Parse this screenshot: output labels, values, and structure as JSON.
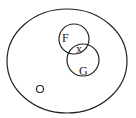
{
  "diagram": {
    "type": "venn",
    "universe": {
      "cx": 67,
      "cy": 61,
      "rx": 60,
      "ry": 52
    },
    "sets": [
      {
        "name": "F",
        "label": "F",
        "cx": 74,
        "cy": 39,
        "r": 15,
        "label_x": 62,
        "label_y": 42
      },
      {
        "name": "G",
        "label": "G",
        "cx": 83,
        "cy": 60,
        "r": 16,
        "label_x": 80,
        "label_y": 75
      }
    ],
    "intersection_label": {
      "text": "x",
      "x": 77,
      "y": 53
    },
    "small_circle": {
      "cx": 40,
      "cy": 89,
      "r": 3.5
    },
    "stroke_color": "#222222",
    "background": "#ffffff"
  }
}
